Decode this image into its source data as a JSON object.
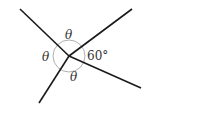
{
  "diagram": {
    "center": [
      69,
      56
    ],
    "lines": [
      {
        "name": "ray-upper-left",
        "x2": 20,
        "y2": 9
      },
      {
        "name": "ray-upper-right",
        "x2": 132,
        "y2": 9
      },
      {
        "name": "ray-lower-right",
        "x2": 141,
        "y2": 88
      },
      {
        "name": "ray-lower-left",
        "x2": 39,
        "y2": 103
      }
    ],
    "labels": {
      "top": "θ",
      "left": "θ",
      "bottom": "θ",
      "right": "60°"
    },
    "colors": {
      "line": "#1a1a1a",
      "arc": "#999999",
      "text": "#333333"
    }
  }
}
